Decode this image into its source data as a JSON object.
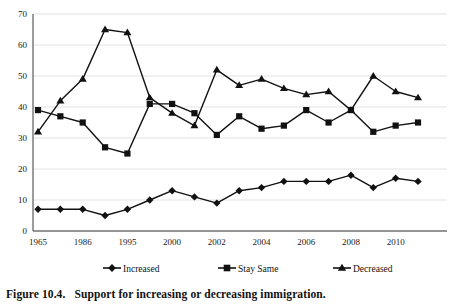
{
  "figure": {
    "caption_number": "Figure 10.4.",
    "caption_text": "Support for increasing or decreasing immigration."
  },
  "chart_data": {
    "type": "line",
    "title": "",
    "xlabel": "",
    "ylabel": "",
    "ylim": [
      0,
      70
    ],
    "ytick_step": 10,
    "yticks": [
      0,
      10,
      20,
      30,
      40,
      50,
      60,
      70
    ],
    "grid": true,
    "legend_position": "bottom",
    "x": [
      "1965",
      "",
      "1986",
      "",
      "1995",
      "",
      "2000",
      "",
      "2002",
      "",
      "2004",
      "",
      "2006",
      "",
      "2008",
      "",
      "2010",
      ""
    ],
    "categories": [
      "1965",
      "1977",
      "1986",
      "1991",
      "1995",
      "1997",
      "2000",
      "2001",
      "2002",
      "2003",
      "2004",
      "2005",
      "2006",
      "2007",
      "2008",
      "2009",
      "2010",
      "2011"
    ],
    "xtick_labels": [
      "1965",
      "1986",
      "1995",
      "2000",
      "2002",
      "2004",
      "2006",
      "2008",
      "2010"
    ],
    "series": [
      {
        "name": "Increased",
        "marker": "diamond",
        "color": "#111111",
        "values": [
          7,
          7,
          7,
          5,
          7,
          10,
          13,
          11,
          9,
          13,
          14,
          16,
          16,
          16,
          18,
          14,
          17,
          16
        ]
      },
      {
        "name": "Stay Same",
        "marker": "square",
        "color": "#111111",
        "values": [
          39,
          37,
          35,
          27,
          25,
          41,
          41,
          38,
          31,
          37,
          33,
          34,
          39,
          35,
          39,
          32,
          34,
          35
        ]
      },
      {
        "name": "Decreased",
        "marker": "triangle",
        "color": "#111111",
        "values": [
          32,
          42,
          49,
          65,
          64,
          43,
          38,
          34,
          52,
          47,
          49,
          46,
          44,
          45,
          39,
          50,
          45,
          43
        ]
      }
    ]
  },
  "legend": {
    "items": [
      {
        "label": "Increased",
        "marker": "diamond"
      },
      {
        "label": "Stay Same",
        "marker": "square"
      },
      {
        "label": "Decreased",
        "marker": "triangle"
      }
    ]
  }
}
